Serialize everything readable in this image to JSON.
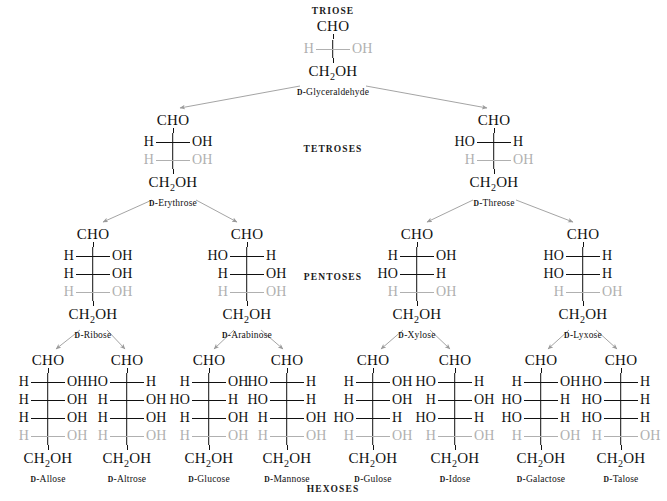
{
  "categories": [
    {
      "label": "TRIOSE",
      "x": 333,
      "y": 6
    },
    {
      "label": "TETROSES",
      "x": 333,
      "y": 144
    },
    {
      "label": "PENTOSES",
      "x": 333,
      "y": 272
    },
    {
      "label": "HEXOSES",
      "x": 333,
      "y": 484
    }
  ],
  "molecule_labels": {
    "top": "CHO",
    "bottom": "CH",
    "bottom_sub": "2",
    "bottom_tail": "OH",
    "h": "H",
    "oh": "OH",
    "ho": "HO",
    "d_prefix": "D"
  },
  "sugars": [
    {
      "name": "Glyceraldehyde",
      "full_name": "D-Glyceraldehyde",
      "tier": "triose",
      "x": 333,
      "y": 18,
      "rows": [
        {
          "left": "H",
          "right": "OH",
          "grey": true
        }
      ]
    },
    {
      "name": "Erythrose",
      "full_name": "D-Erythrose",
      "tier": "tetrose",
      "x": 173,
      "y": 112,
      "rows": [
        {
          "left": "H",
          "right": "OH",
          "grey": false
        },
        {
          "left": "H",
          "right": "OH",
          "grey": true
        }
      ]
    },
    {
      "name": "Threose",
      "full_name": "D-Threose",
      "tier": "tetrose",
      "x": 494,
      "y": 112,
      "rows": [
        {
          "left": "HO",
          "right": "H",
          "grey": false
        },
        {
          "left": "H",
          "right": "OH",
          "grey": true
        }
      ]
    },
    {
      "name": "Ribose",
      "full_name": "D-Ribose",
      "tier": "pentose",
      "x": 93,
      "y": 226,
      "rows": [
        {
          "left": "H",
          "right": "OH",
          "grey": false
        },
        {
          "left": "H",
          "right": "OH",
          "grey": false
        },
        {
          "left": "H",
          "right": "OH",
          "grey": true
        }
      ]
    },
    {
      "name": "Arabinose",
      "full_name": "D-Arabinose",
      "tier": "pentose",
      "x": 247,
      "y": 226,
      "rows": [
        {
          "left": "HO",
          "right": "H",
          "grey": false
        },
        {
          "left": "H",
          "right": "OH",
          "grey": false
        },
        {
          "left": "H",
          "right": "OH",
          "grey": true
        }
      ]
    },
    {
      "name": "Xylose",
      "full_name": "D-Xylose",
      "tier": "pentose",
      "x": 417,
      "y": 226,
      "rows": [
        {
          "left": "H",
          "right": "OH",
          "grey": false
        },
        {
          "left": "HO",
          "right": "H",
          "grey": false
        },
        {
          "left": "H",
          "right": "OH",
          "grey": true
        }
      ]
    },
    {
      "name": "Lyxose",
      "full_name": "D-Lyxose",
      "tier": "pentose",
      "x": 583,
      "y": 226,
      "rows": [
        {
          "left": "HO",
          "right": "H",
          "grey": false
        },
        {
          "left": "HO",
          "right": "H",
          "grey": false
        },
        {
          "left": "H",
          "right": "OH",
          "grey": true
        }
      ]
    },
    {
      "name": "Allose",
      "full_name": "D-Allose",
      "tier": "hexose",
      "x": 48,
      "y": 352,
      "rows": [
        {
          "left": "H",
          "right": "OH",
          "grey": false
        },
        {
          "left": "H",
          "right": "OH",
          "grey": false
        },
        {
          "left": "H",
          "right": "OH",
          "grey": false
        },
        {
          "left": "H",
          "right": "OH",
          "grey": true
        }
      ]
    },
    {
      "name": "Altrose",
      "full_name": "D-Altrose",
      "tier": "hexose",
      "x": 127,
      "y": 352,
      "rows": [
        {
          "left": "HO",
          "right": "H",
          "grey": false
        },
        {
          "left": "H",
          "right": "OH",
          "grey": false
        },
        {
          "left": "H",
          "right": "OH",
          "grey": false
        },
        {
          "left": "H",
          "right": "OH",
          "grey": true
        }
      ]
    },
    {
      "name": "Glucose",
      "full_name": "D-Glucose",
      "tier": "hexose",
      "x": 209,
      "y": 352,
      "rows": [
        {
          "left": "H",
          "right": "OH",
          "grey": false
        },
        {
          "left": "HO",
          "right": "H",
          "grey": false
        },
        {
          "left": "H",
          "right": "OH",
          "grey": false
        },
        {
          "left": "H",
          "right": "OH",
          "grey": true
        }
      ]
    },
    {
      "name": "Mannose",
      "full_name": "D-Mannose",
      "tier": "hexose",
      "x": 287,
      "y": 352,
      "rows": [
        {
          "left": "HO",
          "right": "H",
          "grey": false
        },
        {
          "left": "HO",
          "right": "H",
          "grey": false
        },
        {
          "left": "H",
          "right": "OH",
          "grey": false
        },
        {
          "left": "H",
          "right": "OH",
          "grey": true
        }
      ]
    },
    {
      "name": "Gulose",
      "full_name": "D-Gulose",
      "tier": "hexose",
      "x": 373,
      "y": 352,
      "rows": [
        {
          "left": "H",
          "right": "OH",
          "grey": false
        },
        {
          "left": "H",
          "right": "OH",
          "grey": false
        },
        {
          "left": "HO",
          "right": "H",
          "grey": false
        },
        {
          "left": "H",
          "right": "OH",
          "grey": true
        }
      ]
    },
    {
      "name": "Idose",
      "full_name": "D-Idose",
      "tier": "hexose",
      "x": 455,
      "y": 352,
      "rows": [
        {
          "left": "HO",
          "right": "H",
          "grey": false
        },
        {
          "left": "H",
          "right": "OH",
          "grey": false
        },
        {
          "left": "HO",
          "right": "H",
          "grey": false
        },
        {
          "left": "H",
          "right": "OH",
          "grey": true
        }
      ]
    },
    {
      "name": "Galactose",
      "full_name": "D-Galactose",
      "tier": "hexose",
      "x": 541,
      "y": 352,
      "rows": [
        {
          "left": "H",
          "right": "OH",
          "grey": false
        },
        {
          "left": "HO",
          "right": "H",
          "grey": false
        },
        {
          "left": "HO",
          "right": "H",
          "grey": false
        },
        {
          "left": "H",
          "right": "OH",
          "grey": true
        }
      ]
    },
    {
      "name": "Talose",
      "full_name": "D-Talose",
      "tier": "hexose",
      "x": 621,
      "y": 352,
      "rows": [
        {
          "left": "HO",
          "right": "H",
          "grey": false
        },
        {
          "left": "HO",
          "right": "H",
          "grey": false
        },
        {
          "left": "HO",
          "right": "H",
          "grey": false
        },
        {
          "left": "H",
          "right": "OH",
          "grey": true
        }
      ]
    }
  ],
  "arrows": [
    {
      "from": "D-Glyceraldehyde",
      "to": "D-Erythrose",
      "x1": 300,
      "y1": 86,
      "x2": 180,
      "y2": 108
    },
    {
      "from": "D-Glyceraldehyde",
      "to": "D-Threose",
      "x1": 366,
      "y1": 86,
      "x2": 487,
      "y2": 108
    },
    {
      "from": "D-Erythrose",
      "to": "D-Ribose",
      "x1": 152,
      "y1": 200,
      "x2": 103,
      "y2": 222
    },
    {
      "from": "D-Erythrose",
      "to": "D-Arabinose",
      "x1": 196,
      "y1": 200,
      "x2": 237,
      "y2": 222
    },
    {
      "from": "D-Threose",
      "to": "D-Xylose",
      "x1": 473,
      "y1": 200,
      "x2": 427,
      "y2": 222
    },
    {
      "from": "D-Threose",
      "to": "D-Lyxose",
      "x1": 516,
      "y1": 200,
      "x2": 573,
      "y2": 222
    },
    {
      "from": "D-Ribose",
      "to": "D-Allose",
      "x1": 80,
      "y1": 330,
      "x2": 56,
      "y2": 349
    },
    {
      "from": "D-Ribose",
      "to": "D-Altrose",
      "x1": 107,
      "y1": 330,
      "x2": 125,
      "y2": 349
    },
    {
      "from": "D-Arabinose",
      "to": "D-Glucose",
      "x1": 234,
      "y1": 330,
      "x2": 214,
      "y2": 349
    },
    {
      "from": "D-Arabinose",
      "to": "D-Mannose",
      "x1": 261,
      "y1": 330,
      "x2": 283,
      "y2": 349
    },
    {
      "from": "D-Xylose",
      "to": "D-Gulose",
      "x1": 403,
      "y1": 330,
      "x2": 381,
      "y2": 349
    },
    {
      "from": "D-Xylose",
      "to": "D-Idose",
      "x1": 430,
      "y1": 330,
      "x2": 450,
      "y2": 349
    },
    {
      "from": "D-Lyxose",
      "to": "D-Galactose",
      "x1": 569,
      "y1": 330,
      "x2": 548,
      "y2": 349
    },
    {
      "from": "D-Lyxose",
      "to": "D-Talose",
      "x1": 596,
      "y1": 330,
      "x2": 617,
      "y2": 349
    }
  ],
  "colors": {
    "text": "#111111",
    "greyed": "#b0b0b0",
    "arrow": "#9a9a9a",
    "background": "#ffffff"
  }
}
